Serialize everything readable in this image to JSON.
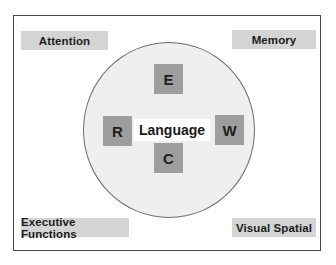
{
  "diagram": {
    "center": {
      "label": "Language"
    },
    "inner_nodes": [
      {
        "key": "top",
        "label": "E"
      },
      {
        "key": "left",
        "label": "R"
      },
      {
        "key": "right",
        "label": "W"
      },
      {
        "key": "bottom",
        "label": "C"
      }
    ],
    "corner_labels": {
      "top_left": "Attention",
      "top_right": "Memory",
      "bottom_left": "Executive Functions",
      "bottom_right": "Visual Spatial"
    },
    "colors": {
      "frame_border": "#4a4a4a",
      "circle_fill": "#efefef",
      "circle_border": "#6e6e6e",
      "label_fill": "#d4d4d4",
      "node_fill": "#9e9e9e",
      "text": "#1c1c1c"
    }
  }
}
